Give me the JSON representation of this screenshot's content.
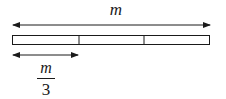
{
  "diagram": {
    "whole_label": "m",
    "part_label": {
      "numerator": "m",
      "denominator": "3"
    },
    "segments": 3,
    "colors": {
      "stroke": "#1a1a1a",
      "fill": "#ffffff"
    }
  }
}
